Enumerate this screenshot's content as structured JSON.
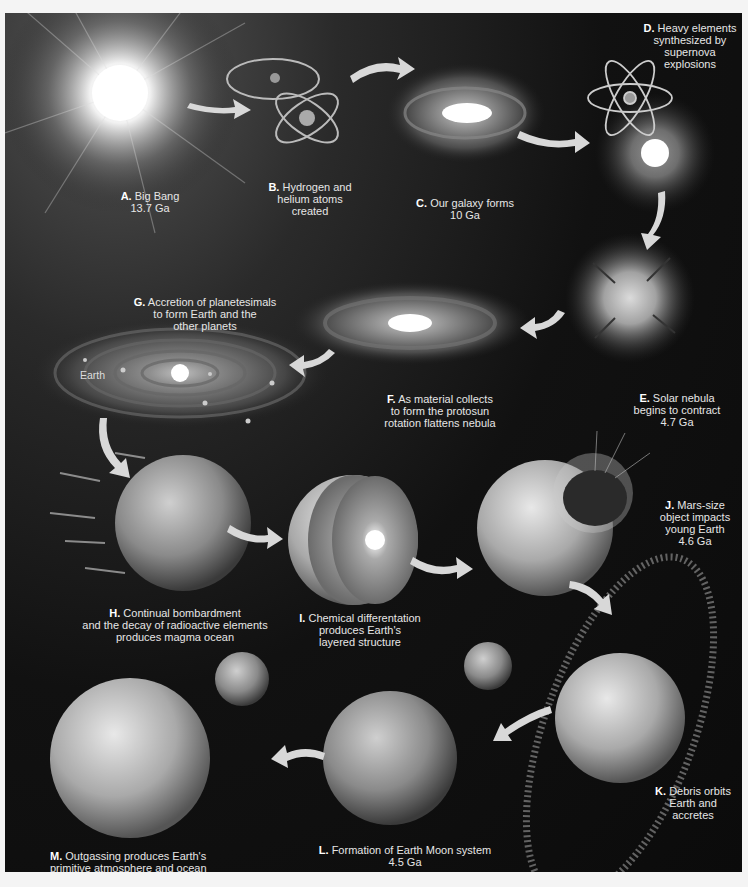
{
  "figure": {
    "theme": "grayscale",
    "background_color": "#0d0d0d",
    "text_color": "#e6e6e6",
    "stages": [
      {
        "letter": "A.",
        "text": "Big Bang",
        "time": "13.7 Ga"
      },
      {
        "letter": "B.",
        "text": "Hydrogen and\nhelium atoms\ncreated",
        "time": ""
      },
      {
        "letter": "C.",
        "text": "Our galaxy forms",
        "time": "10 Ga"
      },
      {
        "letter": "D.",
        "text": "Heavy elements\nsynthesized by\nsupernova\nexplosions",
        "time": ""
      },
      {
        "letter": "E.",
        "text": "Solar nebula\nbegins to contract",
        "time": "4.7 Ga"
      },
      {
        "letter": "F.",
        "text": "As material collects\nto form the protosun\nrotation flattens nebula",
        "time": ""
      },
      {
        "letter": "G.",
        "text": "Accretion of planetesimals\nto form Earth and the\nother planets",
        "time": ""
      },
      {
        "letter": "H.",
        "text": "Continual bombardment\nand the decay of radioactive elements\nproduces magma ocean",
        "time": ""
      },
      {
        "letter": "I.",
        "text": "Chemical differentation\nproduces Earth's\nlayered structure",
        "time": ""
      },
      {
        "letter": "J.",
        "text": "Mars-size\nobject impacts\nyoung Earth",
        "time": "4.6 Ga"
      },
      {
        "letter": "K.",
        "text": "Debris orbits\nEarth and\naccretes",
        "time": ""
      },
      {
        "letter": "L.",
        "text": "Formation of Earth Moon system",
        "time": "4.5 Ga"
      },
      {
        "letter": "M.",
        "text": "Outgassing produces Earth's\nprimitive atmosphere and ocean",
        "time": ""
      }
    ],
    "earth_tag": "Earth"
  }
}
